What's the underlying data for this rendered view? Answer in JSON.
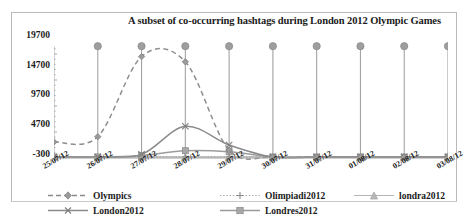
{
  "chart_data": {
    "type": "line",
    "title": "A subset of  co-occurring hashtags during London 2012 Olympic Games",
    "xlabel": "",
    "ylabel": "",
    "grid": false,
    "legend_position": "bottom",
    "categories": [
      "25/07/12",
      "26/07/12",
      "27/07/12",
      "28/07/12",
      "29/07/12",
      "30/07/12",
      "31/07/12",
      "01/08/12",
      "02/08/12",
      "03/08/12"
    ],
    "yticks": [
      "-300",
      "4700",
      "9700",
      "14700",
      "19700"
    ],
    "ylim": [
      -300,
      21700
    ],
    "series": [
      {
        "name": "Olympics",
        "marker": "diamond",
        "style": "dashed",
        "values": [
          2800,
          3800,
          19200,
          18200,
          1200,
          -100,
          -100,
          -100,
          -100,
          -100
        ]
      },
      {
        "name": "Olimpiadi2012",
        "marker": "plus",
        "style": "dotted",
        "values": [
          -100,
          -100,
          -100,
          -100,
          -100,
          -100,
          -100,
          -100,
          -100,
          -100
        ]
      },
      {
        "name": "londra2012",
        "marker": "triangle",
        "style": "solid",
        "values": [
          -100,
          -100,
          -100,
          -100,
          -100,
          -100,
          -100,
          -100,
          -100,
          -100
        ]
      },
      {
        "name": "London2012",
        "marker": "x",
        "style": "solid",
        "values": [
          -100,
          -100,
          400,
          5800,
          2200,
          -100,
          -100,
          -100,
          -100,
          -100
        ]
      },
      {
        "name": "Londres2012",
        "marker": "square",
        "style": "solid",
        "values": [
          -100,
          -100,
          200,
          1100,
          900,
          -100,
          -100,
          -100,
          -100,
          -100
        ]
      }
    ],
    "dropline_markers": {
      "name": "dropline-circles",
      "values": [
        null,
        21200,
        21200,
        21200,
        21200,
        21200,
        21200,
        21200,
        21200,
        21200
      ]
    }
  },
  "legend": {
    "items": [
      {
        "label": "Olympics",
        "key": "olympics-key"
      },
      {
        "label": "Olimpiadi2012",
        "key": "olimpiadi2012-key"
      },
      {
        "label": "londra2012",
        "key": "londra2012-key"
      },
      {
        "label": "London2012",
        "key": "london2012-key"
      },
      {
        "label": "Londres2012",
        "key": "londres2012-key"
      }
    ]
  },
  "colors": {
    "series_gray": "#8a8a8a",
    "dark_gray": "#6f6f6f",
    "text": "#1b1b1b",
    "border": "#b9b9b9",
    "background": "#ffffff"
  }
}
